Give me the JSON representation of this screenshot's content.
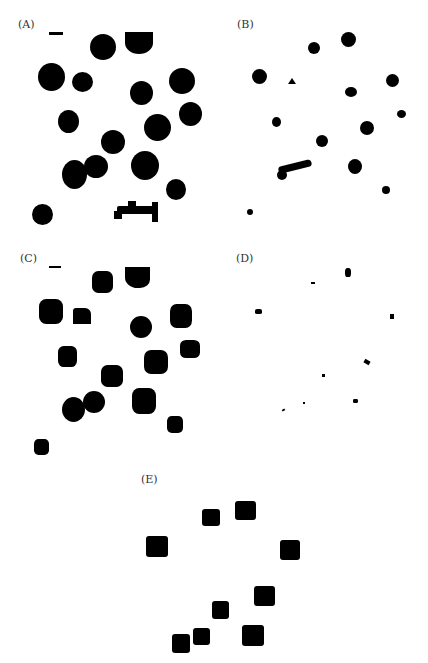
{
  "figure": {
    "panels": [
      {
        "id": "A",
        "label": "(A)",
        "label_pos": [
          18,
          18
        ]
      },
      {
        "id": "B",
        "label": "(B)",
        "label_pos": [
          237,
          18
        ]
      },
      {
        "id": "C",
        "label": "(C)",
        "label_pos": [
          20,
          252
        ]
      },
      {
        "id": "D",
        "label": "(D)",
        "label_pos": [
          236,
          252
        ]
      },
      {
        "id": "E",
        "label": "(E)",
        "label_pos": [
          141,
          473
        ]
      }
    ],
    "colors": {
      "background": "#ffffff",
      "foreground": "#000000",
      "label": "#333333"
    }
  }
}
